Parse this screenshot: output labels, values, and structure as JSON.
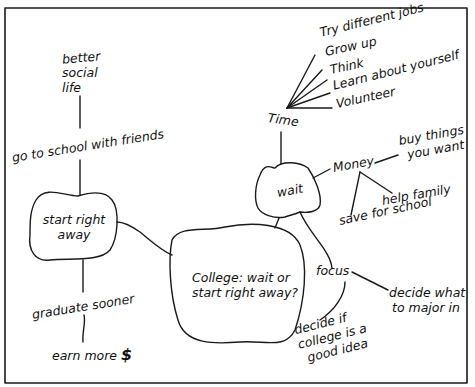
{
  "diagram": {
    "type": "mind-map",
    "colors": {
      "line": "#1a1a1a",
      "background": "#ffffff",
      "text": "#111111"
    },
    "central": {
      "line1": "College: wait or",
      "line2": "start right away?"
    },
    "start_right_away": {
      "label_line1": "start right",
      "label_line2": "away",
      "go_to_school": "go to school with friends",
      "social": {
        "line1": "better",
        "line2": "social",
        "line3": "life"
      },
      "graduate": "graduate sooner",
      "earn_more": "earn more",
      "dollar": "$"
    },
    "wait": {
      "label": "wait",
      "time": {
        "label": "Time",
        "items": [
          "Try different jobs",
          "Grow up",
          "Think",
          "Learn about yourself",
          "Volunteer"
        ]
      },
      "money": {
        "label": "Money",
        "buy": {
          "line1": "buy things",
          "line2": "you want"
        },
        "help_family": "help family",
        "save_school": "save for school"
      },
      "focus": {
        "label": "focus",
        "major": {
          "line1": "decide what",
          "line2": "to major in"
        },
        "college_idea": {
          "line1": "decide if",
          "line2": "college is a",
          "line3": "good idea"
        }
      }
    }
  }
}
